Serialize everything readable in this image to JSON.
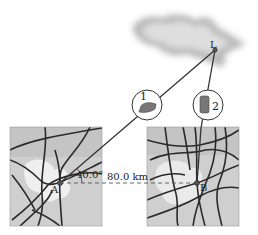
{
  "diagram": {
    "point_A_label": "A",
    "point_B_label": "B",
    "point_L_label": "L",
    "angle_label": "40.0°",
    "distance_label": "80.0 km",
    "car1_label": "1",
    "car2_label": "2",
    "colors": {
      "map_bg": "#cfcfcf",
      "map_light": "#ececec",
      "road": "#2a2a2a",
      "line": "#333333",
      "cloud": "#bdbdbd"
    }
  }
}
